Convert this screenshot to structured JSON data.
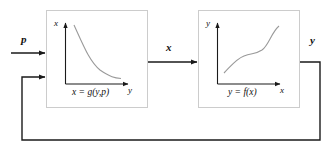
{
  "diagram": {
    "type": "block-diagram-feedback-loop",
    "title": "",
    "background_color": "#ffffff",
    "box_border_color": "#cccccc",
    "line_color": "#1a1a1a",
    "curve_color": "#9a9a9a",
    "text_color": "#111111",
    "signals": [
      {
        "name": "input-p",
        "label": "p"
      },
      {
        "name": "intermediate-x",
        "label": "x"
      },
      {
        "name": "output-y",
        "label": "y"
      }
    ],
    "blocks": [
      {
        "name": "block-g",
        "equation": "x = g(y,p)",
        "y_axis_label": "x",
        "x_axis_label": "y",
        "curve_shape": "decreasing-hyperbola"
      },
      {
        "name": "block-f",
        "equation": "y = f(x)",
        "y_axis_label": "y",
        "x_axis_label": "x",
        "curve_shape": "increasing-sigmoid"
      }
    ],
    "feedback": {
      "name": "feedback-path",
      "label": "",
      "description": "output y routed back to block g input"
    }
  }
}
